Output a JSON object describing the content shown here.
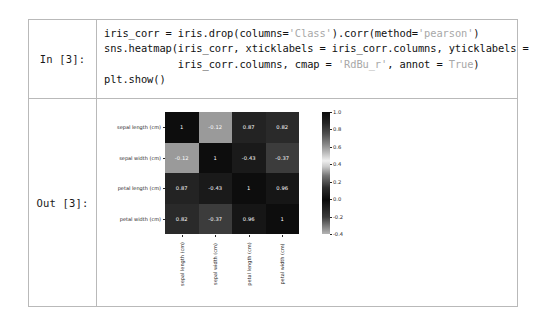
{
  "notebook": {
    "in_prompt": "In [3]:",
    "out_prompt": "Out [3]:",
    "code": {
      "line1_a": "iris_corr = iris.drop(columns=",
      "line1_str1": "'Class'",
      "line1_b": ").corr(method=",
      "line1_str2": "'pearson'",
      "line1_c": ")",
      "line2_a": "sns.heatmap(iris_corr, xticklabels = iris_corr.columns, yticklabels =",
      "line3_a": "            iris_corr.columns, cmap = ",
      "line3_str1": "'RdBu_r'",
      "line3_b": ", annot = ",
      "line3_kw": "True",
      "line3_c": ")",
      "line4_a": "plt.show()"
    }
  },
  "chart_data": {
    "type": "heatmap",
    "title": "",
    "xlabel": "",
    "ylabel": "",
    "categories": [
      "sepal length (cm)",
      "sepal width (cm)",
      "petal length (cm)",
      "petal width (cm)"
    ],
    "row_labels": [
      "sepal length (cm)",
      "sepal width (cm)",
      "petal length (cm)",
      "petal width (cm)"
    ],
    "col_labels": [
      "sepal length (cm)",
      "sepal width (cm)",
      "petal length (cm)",
      "petal width (cm)"
    ],
    "values": [
      [
        1,
        -0.12,
        0.87,
        0.82
      ],
      [
        -0.12,
        1,
        -0.43,
        -0.37
      ],
      [
        0.87,
        -0.43,
        1,
        0.96
      ],
      [
        0.82,
        -0.37,
        0.96,
        1
      ]
    ],
    "annotations": [
      [
        "1",
        "-0.12",
        "0.87",
        "0.82"
      ],
      [
        "-0.12",
        "1",
        "-0.43",
        "-0.37"
      ],
      [
        "0.87",
        "-0.43",
        "1",
        "0.96"
      ],
      [
        "0.82",
        "-0.37",
        "0.96",
        "1"
      ]
    ],
    "cell_colors": [
      [
        "#0d0d0d",
        "#9a9a9a",
        "#232323",
        "#2a2a2a"
      ],
      [
        "#9a9a9a",
        "#0d0d0d",
        "#1a1a1a",
        "#3c3c3c"
      ],
      [
        "#232323",
        "#1a1a1a",
        "#0d0d0d",
        "#161616"
      ],
      [
        "#2a2a2a",
        "#3c3c3c",
        "#161616",
        "#0d0d0d"
      ]
    ],
    "annot": true,
    "cmap": "RdBu_r",
    "colorbar": {
      "ticks": [
        "1.0",
        "0.8",
        "0.6",
        "0.4",
        "0.2",
        "0.0",
        "-0.2",
        "-0.4"
      ],
      "tick_values": [
        1.0,
        0.8,
        0.6,
        0.4,
        0.2,
        0.0,
        -0.2,
        -0.4
      ],
      "vmin": -0.4,
      "vmax": 1.0,
      "position": "right"
    },
    "grid": false,
    "legend": "colorbar-right"
  }
}
